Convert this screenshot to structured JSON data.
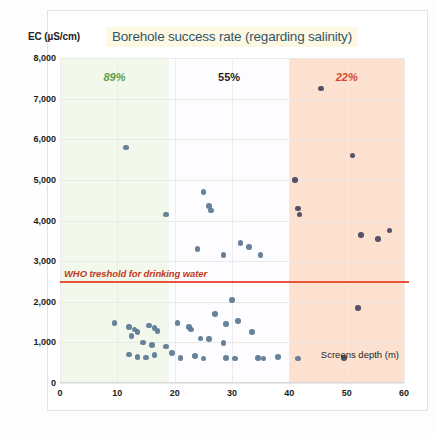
{
  "header": {
    "y_axis_label": "EC (µS/cm)",
    "title": "Borehole success rate (regarding salinity)",
    "title_highlight_color": "#fcf8e2",
    "title_color": "#36566b"
  },
  "legend": {
    "x_axis_label": "Screens depth (m)"
  },
  "annotations": {
    "who_label": "WHO treshold for drinking water",
    "who_value": 2500,
    "who_color": "#e8543b",
    "pct_shallow": "89%",
    "pct_mid": "55%",
    "pct_deep": "22%"
  },
  "caption": {
    "text": ""
  },
  "chart_data": {
    "type": "scatter",
    "title": "Borehole success rate (regarding salinity)",
    "xlabel": "Screens depth (m)",
    "ylabel": "EC (µS/cm)",
    "xlim": [
      0,
      60
    ],
    "ylim": [
      0,
      8000
    ],
    "xticks": [
      0,
      10,
      20,
      30,
      40,
      50,
      60
    ],
    "yticks": [
      0,
      1000,
      2000,
      3000,
      4000,
      5000,
      6000,
      7000,
      8000
    ],
    "ytick_labels": [
      "0",
      "1,000",
      "2,000",
      "3,000",
      "4,000",
      "5,000",
      "6,000",
      "7,000",
      "8,000"
    ],
    "xtick_labels": [
      "0",
      "10",
      "20",
      "30",
      "40",
      "50",
      "60"
    ],
    "grid": true,
    "legend_position": "inside-bottom-right",
    "bands": [
      {
        "label": "89%",
        "x_start": 0,
        "x_end": 19,
        "color": "#eef6e4",
        "text_color": "#5f9e49",
        "success_rate": 89
      },
      {
        "label": "55%",
        "x_start": 19,
        "x_end": 40,
        "color": "#fdfdff",
        "text_color": "#262626",
        "success_rate": 55
      },
      {
        "label": "22%",
        "x_start": 40,
        "x_end": 60,
        "color": "#fbdcc8",
        "text_color": "#d5472b",
        "success_rate": 22
      }
    ],
    "threshold_line": {
      "label": "WHO treshold for drinking water",
      "y": 2500,
      "color": "#e8543b"
    },
    "series": [
      {
        "name": "Boreholes",
        "color": "#5b7794",
        "points": [
          [
            11.5,
            5800
          ],
          [
            18.5,
            4150
          ],
          [
            25.0,
            4700
          ],
          [
            26.0,
            4350
          ],
          [
            26.3,
            4250
          ],
          [
            24.0,
            3300
          ],
          [
            28.5,
            3150
          ],
          [
            31.5,
            3450
          ],
          [
            33.0,
            3350
          ],
          [
            35.0,
            3150
          ],
          [
            30.0,
            2050
          ],
          [
            9.5,
            1480
          ],
          [
            12.0,
            1380
          ],
          [
            13.0,
            1320
          ],
          [
            13.5,
            1250
          ],
          [
            15.5,
            1420
          ],
          [
            16.5,
            1350
          ],
          [
            17.0,
            1280
          ],
          [
            12.5,
            1150
          ],
          [
            14.5,
            1000
          ],
          [
            16.0,
            940
          ],
          [
            18.5,
            900
          ],
          [
            20.5,
            1480
          ],
          [
            22.5,
            1380
          ],
          [
            22.8,
            1320
          ],
          [
            24.5,
            1100
          ],
          [
            27.0,
            1700
          ],
          [
            29.0,
            1450
          ],
          [
            26.0,
            1080
          ],
          [
            28.5,
            980
          ],
          [
            31.0,
            1530
          ],
          [
            33.5,
            1250
          ],
          [
            12.0,
            700
          ],
          [
            13.5,
            640
          ],
          [
            15.0,
            630
          ],
          [
            16.5,
            690
          ],
          [
            19.5,
            740
          ],
          [
            21.0,
            620
          ],
          [
            23.5,
            660
          ],
          [
            25.0,
            600
          ],
          [
            29.0,
            620
          ],
          [
            30.5,
            600
          ],
          [
            34.5,
            620
          ],
          [
            35.5,
            600
          ],
          [
            38.0,
            640
          ],
          [
            41.5,
            600
          ]
        ]
      },
      {
        "name": "Boreholes (deep zone)",
        "color": "#4b4a63",
        "points": [
          [
            45.5,
            7250
          ],
          [
            41.0,
            5000
          ],
          [
            51.0,
            5600
          ],
          [
            41.5,
            4300
          ],
          [
            41.8,
            4150
          ],
          [
            52.5,
            3650
          ],
          [
            55.5,
            3550
          ],
          [
            57.5,
            3750
          ],
          [
            52.0,
            1850
          ],
          [
            49.5,
            620
          ]
        ]
      }
    ]
  }
}
